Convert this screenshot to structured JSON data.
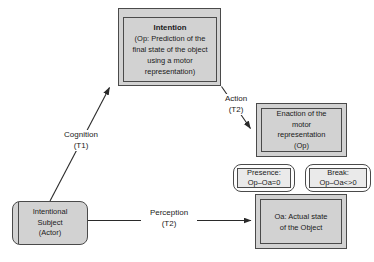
{
  "diagram": {
    "nodes": {
      "intention": {
        "title": "Intention",
        "lines": [
          "(Op: Prediction of the",
          "final state of the object",
          "using a motor",
          "representation)"
        ]
      },
      "enaction": {
        "lines": [
          "Enaction of the",
          "motor",
          "representation",
          "(Op)"
        ]
      },
      "presence": {
        "lines": [
          "Presence:",
          "Op–Oa=0"
        ]
      },
      "break": {
        "lines": [
          "Break:",
          "Op–Oa<>0"
        ]
      },
      "oa": {
        "lines": [
          "Oa: Actual state",
          "of the Object"
        ]
      },
      "subject": {
        "lines": [
          "Intentional",
          "Subject",
          "(Actor)"
        ]
      }
    },
    "edges": {
      "cognition": {
        "label": "Cognition",
        "time": "(T1)"
      },
      "action": {
        "label": "Action",
        "time": "(T2)"
      },
      "perception": {
        "label": "Perception",
        "time": "(T2)"
      }
    },
    "colors": {
      "box_fill": "#d2d2d2",
      "pill_ring_fill": "#fdfdfd",
      "pill_inner_fill": "#eaeaea",
      "border": "#4a4a4a",
      "line": "#2a2a2a",
      "text": "#1a1a1a",
      "background": "#ffffff"
    }
  }
}
